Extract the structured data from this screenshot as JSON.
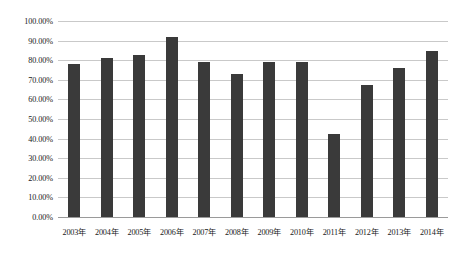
{
  "chart_data": {
    "type": "bar",
    "title": "",
    "xlabel": "",
    "ylabel": "",
    "ylim": [
      0,
      100
    ],
    "grid": true,
    "legend": "none",
    "categories": [
      "2003年",
      "2004年",
      "2005年",
      "2006年",
      "2007年",
      "2008年",
      "2009年",
      "2010年",
      "2011年",
      "2012年",
      "2013年",
      "2014年"
    ],
    "values": [
      78.0,
      81.0,
      82.5,
      92.0,
      79.0,
      73.0,
      79.0,
      79.0,
      42.5,
      67.5,
      76.0,
      84.5
    ],
    "ytick_labels": [
      "100.00%",
      "90.00%",
      "80.00%",
      "70.00%",
      "60.00%",
      "50.00%",
      "40.00%",
      "30.00%",
      "20.00%",
      "10.00%",
      "0.00%"
    ],
    "ytick_values": [
      100,
      90,
      80,
      70,
      60,
      50,
      40,
      30,
      20,
      10,
      0
    ],
    "colors": {
      "bar": "#3a3a3a",
      "gridline": "#c9c9c9",
      "baseline": "#9a9a9a",
      "text": "#1a1a1a",
      "background": "#ffffff"
    }
  }
}
